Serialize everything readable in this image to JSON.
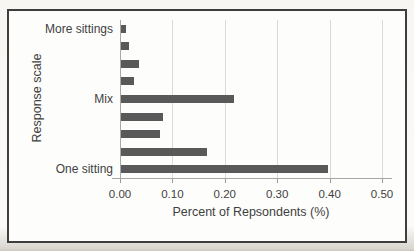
{
  "figure": {
    "border_color": "#3e3e3e",
    "background": "#fdfdfb"
  },
  "chart_data": {
    "type": "bar",
    "orientation": "horizontal",
    "title": "",
    "xlabel": "Percent of Repsondents (%)",
    "ylabel": "Response scale",
    "categories": [
      "More sittings",
      "",
      "",
      "",
      "Mix",
      "",
      "",
      "",
      "One sitting"
    ],
    "values": [
      0.01,
      0.015,
      0.035,
      0.025,
      0.215,
      0.08,
      0.075,
      0.165,
      0.395
    ],
    "xlim": [
      0,
      0.5
    ],
    "xticks": [
      0,
      0.1,
      0.2,
      0.3,
      0.4,
      0.5
    ],
    "xtick_labels": [
      "0.00",
      "0.10",
      "0.20",
      "0.30",
      "0.40",
      "0.50"
    ],
    "grid": true,
    "legend": false,
    "bar_color": "#595959",
    "gridline_color": "#dadada",
    "axis_line_color": "#a8a8a8",
    "tick_color": "#9b9b9b",
    "text_color": "#3f3f3f"
  }
}
